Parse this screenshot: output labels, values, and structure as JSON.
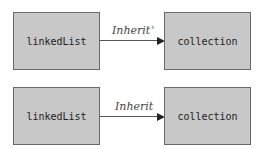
{
  "diagrams": [
    {
      "source": "linkedList",
      "target": "collection",
      "edge_label": "Inherit",
      "edge_superscript": "+"
    },
    {
      "source": "linkedList",
      "target": "collection",
      "edge_label": "Inherit",
      "edge_superscript": ""
    }
  ]
}
